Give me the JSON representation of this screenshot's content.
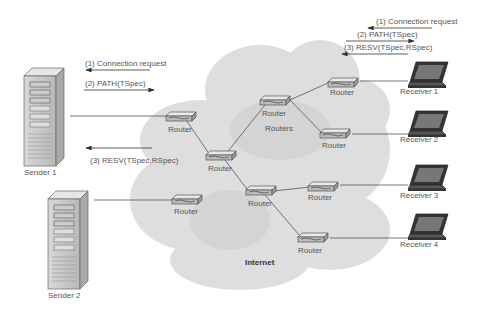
{
  "diagram": {
    "cloud_label": "Internet",
    "core_label": "Routers",
    "router_label": "Router",
    "senders": [
      {
        "label": "Sender 1"
      },
      {
        "label": "Sender 2"
      }
    ],
    "receivers": [
      {
        "label": "Receiver 1"
      },
      {
        "label": "Receiver 2"
      },
      {
        "label": "Receiver 3"
      },
      {
        "label": "Receiver 4"
      }
    ],
    "sender_messages": [
      {
        "label": "(1) Connection request",
        "direction": "left"
      },
      {
        "label": "(2) PATH(TSpec)",
        "direction": "right"
      },
      {
        "label": "(3) RESV(TSpec,RSpec)",
        "direction": "left"
      }
    ],
    "receiver_messages": [
      {
        "label": "(1) Connection request",
        "direction": "left"
      },
      {
        "label": "(2) PATH(TSpec)",
        "direction": "right"
      },
      {
        "label": "(3) RESV(TSpec,RSpec)",
        "direction": "left"
      }
    ],
    "colors": {
      "cloud": "#dcdcdc",
      "line": "#555555",
      "text": "#555555"
    }
  }
}
